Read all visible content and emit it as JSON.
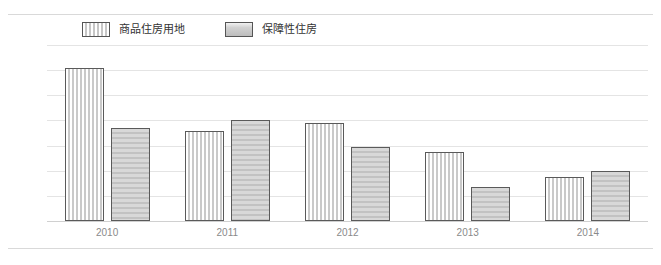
{
  "chart_data": {
    "type": "bar",
    "title": "",
    "xlabel": "",
    "ylabel": "",
    "categories": [
      "2010",
      "2011",
      "2012",
      "2013",
      "2014"
    ],
    "series": [
      {
        "name": "商品住房用地",
        "values": [
          61,
          36,
          39,
          27.5,
          17.5
        ]
      },
      {
        "name": "保障性住房",
        "values": [
          37,
          40,
          29.5,
          13.5,
          20
        ]
      }
    ],
    "ylim": [
      0,
      70
    ],
    "yticks": [
      0,
      10,
      20,
      30,
      40,
      50,
      60,
      70
    ],
    "ytick_labels": [
      "0",
      "10",
      "20",
      "30",
      "40",
      "50",
      "60",
      "70"
    ],
    "grid": true,
    "legend_position": "top-left"
  },
  "legend": {
    "items": [
      {
        "label": "商品住房用地",
        "swatch": "striped-swatch"
      },
      {
        "label": "保障性住房",
        "swatch": "solid-swatch"
      }
    ]
  },
  "colors": {
    "bar_stripe": "#c9c9c9",
    "bar_solid": "#c9c9c9",
    "bar_border": "#5a5a5a",
    "gridline": "#e4e4e4",
    "tick_text": "#8a8a8a",
    "legend_text": "#333333",
    "background": "#ffffff"
  }
}
